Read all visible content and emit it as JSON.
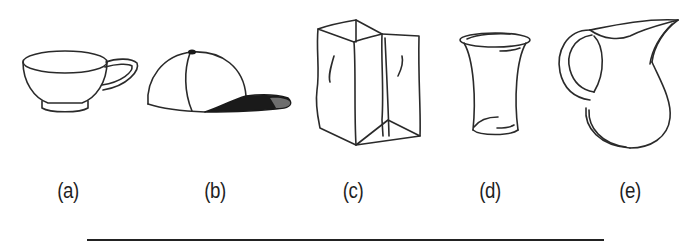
{
  "figure": {
    "items": [
      {
        "id": "a",
        "label": "(a)",
        "object": "teacup"
      },
      {
        "id": "b",
        "label": "(b)",
        "object": "baseball-cap"
      },
      {
        "id": "c",
        "label": "(c)",
        "object": "paper-bag"
      },
      {
        "id": "d",
        "label": "(d)",
        "object": "drinking-glass"
      },
      {
        "id": "e",
        "label": "(e)",
        "object": "pitcher"
      }
    ],
    "colors": {
      "stroke": "#2a2a2a",
      "cap_brim_dark": "#1a1a1a",
      "cap_brim_light": "#6e6e6e",
      "background": "#ffffff"
    }
  }
}
